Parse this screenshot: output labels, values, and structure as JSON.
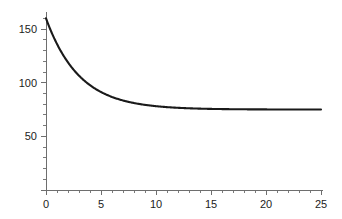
{
  "chart_data": {
    "type": "line",
    "title": "",
    "subtitle": "",
    "xlabel": "",
    "ylabel": "",
    "xlim": [
      0,
      25
    ],
    "ylim": [
      0,
      165
    ],
    "grid": false,
    "legend": false,
    "legend_position": "none",
    "background_color": "#ffffff",
    "axis_color": "#6e6e6e",
    "curve_color": "#1a1a1a",
    "label_color": "#1c1c1c",
    "x_ticks_major": [
      0,
      5,
      10,
      15,
      20,
      25
    ],
    "x_tick_labels": [
      "0",
      "5",
      "10",
      "15",
      "20",
      "25"
    ],
    "x_minor_per_interval": 4,
    "y_ticks_major": [
      0,
      50,
      100,
      150
    ],
    "y_tick_labels": [
      "0",
      "50",
      "100",
      "150"
    ],
    "y_tick_labels_shown": [
      "50",
      "100",
      "150"
    ],
    "y_minor_step": 10,
    "asymptote": 75,
    "initial_value": 160,
    "decay_rate": 0.33,
    "series": [
      {
        "name": "decay",
        "x": [
          0,
          0.5,
          1,
          1.5,
          2,
          2.5,
          3,
          3.5,
          4,
          4.5,
          5,
          5.5,
          6,
          6.5,
          7,
          7.5,
          8,
          8.5,
          9,
          9.5,
          10,
          11,
          12,
          13,
          14,
          15,
          16,
          17,
          18,
          19,
          20,
          21,
          22,
          23,
          24,
          25
        ],
        "values": [
          160,
          147.1,
          136.1,
          126.8,
          118.9,
          112.1,
          106.5,
          101.6,
          97.7,
          94.2,
          91.3,
          88.9,
          86.8,
          85.0,
          83.5,
          82.3,
          81.2,
          80.3,
          79.5,
          78.8,
          78.3,
          77.4,
          76.7,
          76.3,
          76.0,
          75.7,
          75.5,
          75.4,
          75.3,
          75.2,
          75.1,
          75.1,
          75.1,
          75.0,
          75.0,
          75.0
        ]
      }
    ]
  },
  "geometry": {
    "x_axis_pixel_start": 46,
    "x_axis_pixel_end": 321,
    "y_axis_pixel_top": 13,
    "y_axis_pixel_bottom": 190
  }
}
